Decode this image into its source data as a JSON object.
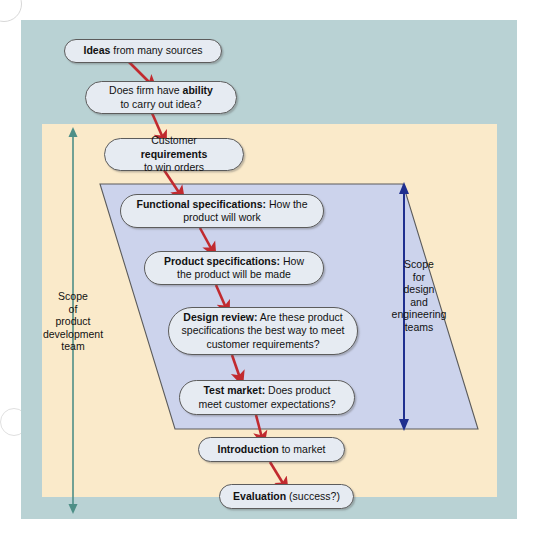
{
  "diagram": {
    "colors": {
      "panel_outer": "#b9d2d4",
      "panel_inner": "#faeaca",
      "parallelogram_fill": "#ccd3ec",
      "parallelogram_stroke": "#5b5b5b",
      "box_fill": "#e6ebf2",
      "box_stroke": "#5c5c5c",
      "flow_arrow": "#c12a2f",
      "scope_left_arrow": "#4e8f87",
      "scope_right_arrow": "#1f2f8f",
      "text": "#111111",
      "page_background": "#ffffff"
    }
  },
  "steps": [
    {
      "id": "ideas",
      "name": "ideas",
      "bold": "Ideas",
      "rest": " from many sources",
      "lines": [
        "Ideas from many sources"
      ]
    },
    {
      "id": "ability",
      "name": "firm-ability",
      "line1_pre": "Does firm have ",
      "line1_bold": "ability",
      "line2": "to carry out idea?"
    },
    {
      "id": "customer-requirements",
      "name": "customer-requirements",
      "line1_pre": "Customer ",
      "line1_bold": "requirements",
      "line2": "to win orders"
    },
    {
      "id": "functional-specifications",
      "name": "functional-specifications",
      "bold": "Functional specifications:",
      "rest": " How the product will work"
    },
    {
      "id": "product-specifications",
      "name": "product-specifications",
      "bold": "Product specifications:",
      "rest": " How the product will be made"
    },
    {
      "id": "design-review",
      "name": "design-review",
      "bold": "Design review:",
      "rest": " Are these product specifications the best way to meet customer requirements?"
    },
    {
      "id": "test-market",
      "name": "test-market",
      "bold": "Test market:",
      "rest": " Does product meet customer expectations?"
    },
    {
      "id": "introduction",
      "name": "introduction-to-market",
      "bold": "Introduction",
      "rest": " to market"
    },
    {
      "id": "evaluation",
      "name": "evaluation",
      "bold": "Evaluation",
      "rest": " (success?)"
    }
  ],
  "scopes": {
    "left": {
      "label": "Scope\nof\nproduct\ndevelopment\nteam",
      "arrow": "double-headed-vertical-arrow",
      "color": "#4e8f87"
    },
    "right": {
      "label": "Scope\nfor\ndesign\nand\nengineering\nteams",
      "arrow": "double-headed-vertical-arrow",
      "color": "#1f2f8f"
    }
  }
}
